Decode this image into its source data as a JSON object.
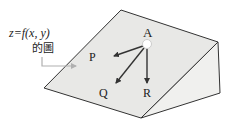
{
  "diagram": {
    "surface_label_line1": "z=f(x, y)",
    "surface_label_line2": "的圖",
    "points": {
      "A": "A",
      "P": "P",
      "Q": "Q",
      "R": "R"
    },
    "colors": {
      "face_top": "#e8e8e6",
      "face_side": "#f0f0ee",
      "edge": "#333333",
      "callout": "#b0b0b0",
      "point_fill": "#ffffff"
    }
  }
}
